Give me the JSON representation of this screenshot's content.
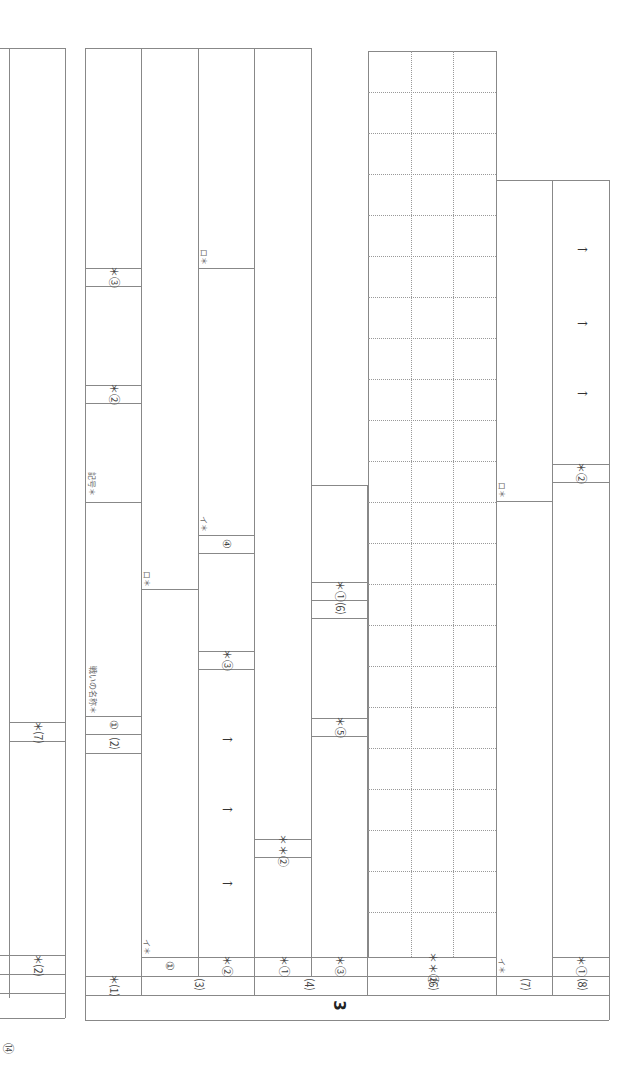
{
  "section_number": "3",
  "page_marker": "⑭",
  "left_panel": {
    "labels": [
      "＊⑶",
      "＊⑺",
      "＊⑵"
    ]
  },
  "columns": {
    "q1": {
      "label": "＊⑴",
      "parts": [
        "＊③",
        "＊②",
        "記号＊",
        "戦いの名称＊",
        "①",
        "⑵"
      ]
    },
    "q3": {
      "label": "⑶",
      "parts": [
        "①",
        "イ＊",
        "ロ＊"
      ]
    },
    "q3_2": {
      "label": "＊②",
      "parts": [
        "ロ＊",
        "イ＊",
        "④",
        "＊③"
      ],
      "arrows": [
        "→",
        "→",
        "→"
      ]
    },
    "q4": {
      "label": "⑷",
      "parts": [
        "＊①",
        "＊＊②"
      ]
    },
    "q4_3": {
      "label": "＊③",
      "parts": [
        "＊①",
        "⑹",
        "＊⑤"
      ]
    },
    "q6": {
      "label": "⑹",
      "parts": [
        "＊＊②"
      ]
    },
    "q7": {
      "label": "⑺",
      "parts": [
        "イ＊",
        "ロ＊"
      ]
    },
    "q8": {
      "label": "⑻",
      "parts": [
        "＊①",
        "＊②"
      ],
      "arrows": [
        "→",
        "→",
        "→"
      ]
    }
  },
  "grid": {
    "rows": 22,
    "cols": 3
  }
}
